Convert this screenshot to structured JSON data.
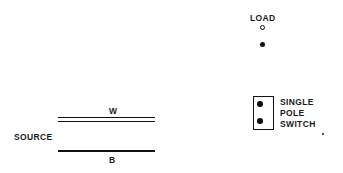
{
  "diagram": {
    "background_color": "#ffffff",
    "ink_color": "#111111",
    "width": 343,
    "height": 173
  },
  "labels": {
    "load": "LOAD",
    "source": "SOURCE",
    "white_wire": "W",
    "black_wire": "B",
    "switch_line1": "SINGLE",
    "switch_line2": "POLE",
    "switch_line3": "SWITCH"
  },
  "components": {
    "load_terminal_upper": {
      "name": "load-terminal-upper",
      "style": "hollow-dot"
    },
    "load_terminal_lower": {
      "name": "load-terminal-lower",
      "style": "solid-dot"
    },
    "switch_terminal_upper": {
      "name": "switch-terminal-upper",
      "style": "solid-dot"
    },
    "switch_terminal_lower": {
      "name": "switch-terminal-lower",
      "style": "solid-dot"
    },
    "white_wire": {
      "name": "white-neutral-wire",
      "style": "double-line"
    },
    "black_wire": {
      "name": "black-hot-wire",
      "style": "single-line"
    },
    "switch_body": {
      "name": "single-pole-switch-body",
      "style": "rectangle"
    }
  }
}
